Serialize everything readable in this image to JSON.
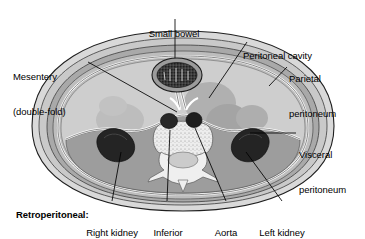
{
  "figure": {
    "type": "anatomical-cross-section",
    "region": "abdomen",
    "view": "transverse / axial section",
    "title": "",
    "colors": {
      "background": "#ffffff",
      "skin_outer": "#d8d8d8",
      "fat_layer": "#c6c6c6",
      "muscle_layer": "#a8a8a8",
      "peritoneal_cavity": "#cfcfcf",
      "organ_shadow": "#a2a2a2",
      "peritoneum_line": "#ffffff",
      "bone": "#ededed",
      "vessel_dark": "#2a2a2a",
      "kidney_dark": "#262626",
      "bowel_dark": "#303030",
      "outline": "#1a1a1a",
      "leader_line": "#000000",
      "text": "#000000"
    }
  },
  "labels": [
    {
      "id": "small-bowel",
      "text": "Small bowel",
      "line1": "Small bowel",
      "line2": "",
      "align": "center",
      "bold": false,
      "x": 129,
      "y": 5,
      "width": 90,
      "leader": {
        "x1": 175,
        "y1": 19,
        "x2": 175,
        "y2": 76
      }
    },
    {
      "id": "peritoneal-cavity",
      "text": "Peritoneal cavity",
      "line1": "Peritoneal cavity",
      "line2": "",
      "align": "left",
      "bold": false,
      "x": 243,
      "y": 27,
      "width": 118,
      "leader": {
        "x1": 247,
        "y1": 42,
        "x2": 208,
        "y2": 98
      }
    },
    {
      "id": "parietal-peritoneum",
      "text": "Parietal peritoneum",
      "line1": "Parietal",
      "line2": "peritoneum",
      "align": "left",
      "bold": false,
      "x": 288,
      "y": 50,
      "width": 76,
      "leader": {
        "x1": 288,
        "y1": 70,
        "x2": 268,
        "y2": 88
      }
    },
    {
      "id": "mesentery",
      "text": "Mesentery (double-fold)",
      "line1": "Mesentery",
      "line2": "(double-fold)",
      "align": "left",
      "bold": false,
      "x": 13,
      "y": 48,
      "width": 74,
      "leader": {
        "x1": 88,
        "y1": 62,
        "x2": 176,
        "y2": 113
      }
    },
    {
      "id": "visceral-peritoneum",
      "text": "Visceral peritoneum",
      "line1": "Visceral",
      "line2": "peritoneum",
      "align": "left",
      "bold": false,
      "x": 298,
      "y": 127,
      "width": 66,
      "leader": {
        "x1": 296,
        "y1": 133,
        "x2": 247,
        "y2": 133
      }
    },
    {
      "id": "retroperitoneal",
      "text": "Retroperitoneal:",
      "line1": "Retroperitoneal:",
      "line2": "",
      "align": "left",
      "bold": true,
      "x": 16,
      "y": 186,
      "width": 95,
      "leader": null
    },
    {
      "id": "right-kidney",
      "text": "Right kidney",
      "line1": "Right kidney",
      "line2": "",
      "align": "center",
      "bold": false,
      "x": 74,
      "y": 204,
      "width": 66,
      "leader": {
        "x1": 112,
        "y1": 203,
        "x2": 127,
        "y2": 146
      }
    },
    {
      "id": "inferior-vena-cava",
      "text": "Inferior vena cava",
      "line1": "Inferior",
      "line2": "vena cava",
      "align": "center",
      "bold": false,
      "x": 140,
      "y": 204,
      "width": 56,
      "leader": {
        "x1": 167,
        "y1": 203,
        "x2": 170,
        "y2": 121
      }
    },
    {
      "id": "aorta",
      "text": "Aorta",
      "line1": "Aorta",
      "line2": "",
      "align": "center",
      "bold": false,
      "x": 209,
      "y": 204,
      "width": 36,
      "leader": {
        "x1": 226,
        "y1": 203,
        "x2": 193,
        "y2": 121
      }
    },
    {
      "id": "left-kidney",
      "text": "Left kidney",
      "line1": "Left kidney",
      "line2": "",
      "align": "center",
      "bold": false,
      "x": 251,
      "y": 204,
      "width": 62,
      "leader": {
        "x1": 282,
        "y1": 203,
        "x2": 242,
        "y2": 146
      }
    }
  ],
  "structures": [
    {
      "id": "skin-subcutaneous",
      "name": "Skin and subcutaneous fat"
    },
    {
      "id": "abdominal-wall-muscle",
      "name": "Abdominal wall musculature"
    },
    {
      "id": "parietal-peritoneum-line",
      "name": "Parietal peritoneum (white line)"
    },
    {
      "id": "peritoneal-cavity-space",
      "name": "Peritoneal cavity"
    },
    {
      "id": "small-bowel-loop",
      "name": "Small bowel loop"
    },
    {
      "id": "mesentery-fold",
      "name": "Mesentery (double fold)"
    },
    {
      "id": "visceral-peritoneum-line",
      "name": "Visceral peritoneum"
    },
    {
      "id": "right-kidney-organ",
      "name": "Right kidney"
    },
    {
      "id": "left-kidney-organ",
      "name": "Left kidney"
    },
    {
      "id": "inferior-vena-cava-vessel",
      "name": "Inferior vena cava"
    },
    {
      "id": "aorta-vessel",
      "name": "Aorta"
    },
    {
      "id": "vertebra-bone",
      "name": "Lumbar vertebra"
    },
    {
      "id": "spinal-canal",
      "name": "Spinal canal"
    },
    {
      "id": "psoas-muscle",
      "name": "Paravertebral / psoas muscle"
    },
    {
      "id": "liver-shadow",
      "name": "Liver"
    },
    {
      "id": "spleen-shadow",
      "name": "Spleen"
    }
  ]
}
